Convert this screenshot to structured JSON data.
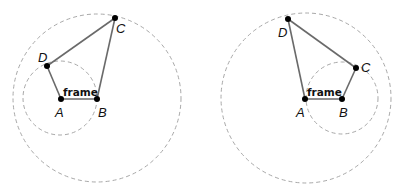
{
  "diagrams": [
    {
      "name": "left-linkage",
      "frame_label": "frame",
      "circles": [
        {
          "cx": 97,
          "cy": 98,
          "r": 84
        },
        {
          "cx": 60,
          "cy": 98,
          "r": 37
        }
      ],
      "points": {
        "A": {
          "x": 61,
          "y": 99,
          "label": "A",
          "lx": 55,
          "ly": 117
        },
        "B": {
          "x": 97,
          "y": 99,
          "label": "B",
          "lx": 98,
          "ly": 117
        },
        "C": {
          "x": 115,
          "y": 18,
          "label": "C",
          "lx": 116,
          "ly": 33
        },
        "D": {
          "x": 47,
          "y": 66,
          "label": "D",
          "lx": 38,
          "ly": 62
        }
      },
      "frame_pos": {
        "x": 63,
        "y": 96
      }
    },
    {
      "name": "right-linkage",
      "frame_label": "frame",
      "circles": [
        {
          "cx": 306,
          "cy": 98,
          "r": 85
        },
        {
          "cx": 342,
          "cy": 98,
          "r": 36
        }
      ],
      "points": {
        "A": {
          "x": 305,
          "y": 99,
          "label": "A",
          "lx": 296,
          "ly": 117
        },
        "B": {
          "x": 342,
          "y": 99,
          "label": "B",
          "lx": 339,
          "ly": 117
        },
        "C": {
          "x": 356,
          "y": 68,
          "label": "C",
          "lx": 361,
          "ly": 72
        },
        "D": {
          "x": 288,
          "y": 19,
          "label": "D",
          "lx": 278,
          "ly": 37
        }
      },
      "frame_pos": {
        "x": 307,
        "y": 96
      }
    }
  ]
}
